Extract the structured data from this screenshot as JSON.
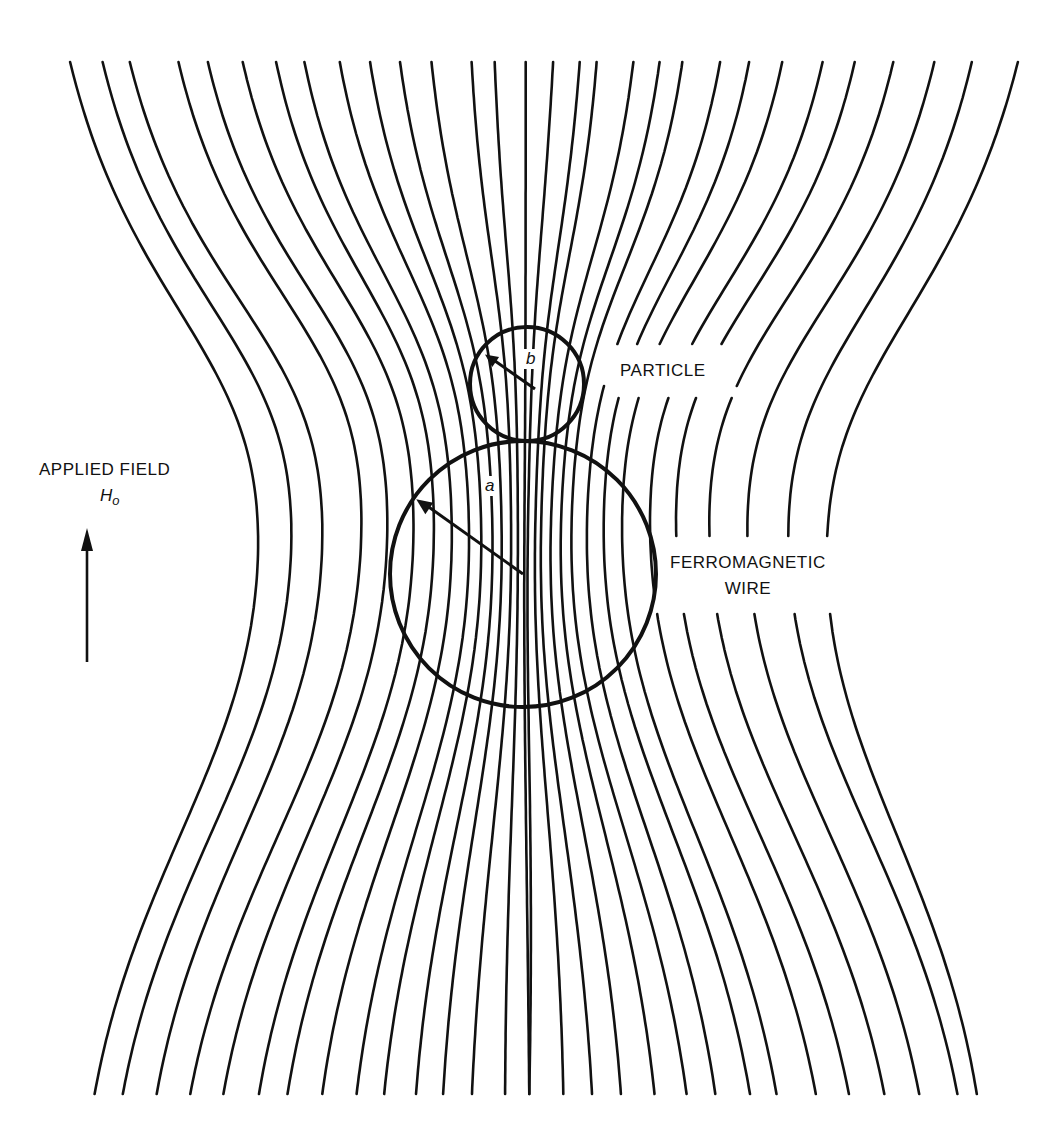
{
  "figure": {
    "type": "magnetic-field-lines",
    "line_color": "#111111",
    "background": "#ffffff",
    "canvas": {
      "width": 1050,
      "height": 1128
    },
    "wire": {
      "cx": 523,
      "cy": 574,
      "r": 133,
      "radius_symbol": "a"
    },
    "particle": {
      "cx": 527,
      "cy": 384,
      "r": 57,
      "radius_symbol": "b"
    },
    "field_lines": {
      "count": 32,
      "top_y": 62,
      "bottom_y": 1097,
      "top_x": [
        42,
        74,
        101,
        150,
        180,
        216,
        251,
        281,
        319,
        352,
        385,
        420,
        465,
        491,
        526,
        557,
        587,
        606,
        647,
        676,
        701,
        742,
        773,
        808,
        850,
        883,
        922,
        963,
        1000,
        1045
      ],
      "bottom_x": [
        68,
        96,
        130,
        164,
        198,
        235,
        265,
        302,
        339,
        369,
        404,
        434,
        466,
        503,
        530,
        568,
        600,
        632,
        669,
        704,
        735,
        772,
        800,
        841,
        875,
        911,
        946,
        984,
        1003
      ]
    }
  },
  "labels": {
    "applied_field": "APPLIED FIELD",
    "applied_field_symbol": "H",
    "applied_field_subscript": "o",
    "particle": "PARTICLE",
    "wire_line1": "FERROMAGNETIC",
    "wire_line2": "WIRE",
    "radius_a": "a",
    "radius_b": "b"
  }
}
